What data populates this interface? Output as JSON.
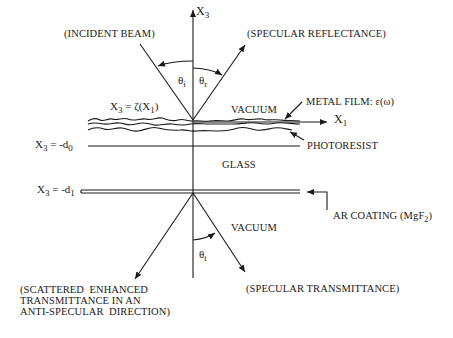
{
  "diagram": {
    "axes": {
      "vertical_label": "X",
      "vertical_sub": "3",
      "horizontal_label": "X",
      "horizontal_sub": "1"
    },
    "beams": {
      "incident": "(INCIDENT  BEAM)",
      "specular_reflectance": "(SPECULAR  REFLECTANCE)",
      "specular_transmittance": "(SPECULAR  TRANSMITTANCE)",
      "scattered_enhanced": "(SCATTERED  ENHANCED\nTRANSMITTANCE IN AN\nANTI-SPECULAR  DIRECTION)"
    },
    "angles": {
      "incident": {
        "sym": "θ",
        "sub": "i"
      },
      "reflected": {
        "sym": "θ",
        "sub": "r"
      },
      "transmitted": {
        "sym": "θ",
        "sub": "t"
      }
    },
    "regions": {
      "vacuum_top": "VACUUM",
      "glass": "GLASS",
      "vacuum_bottom": "VACUUM"
    },
    "layers": {
      "metal_film": "METAL  FILM:  ε(ω)",
      "photoresist": "PHOTORESIST",
      "ar_coating_prefix": "AR  COATING  (MgF",
      "ar_coating_sub": "2",
      "ar_coating_suffix": ")"
    },
    "interfaces": {
      "surface": {
        "lhs": "X",
        "lhs_sub": "3",
        "rhs": " = ζ(X",
        "rhs_sub": "1",
        "close": ")"
      },
      "d0": {
        "lhs": "X",
        "lhs_sub": "3",
        "rhs": " = -d",
        "rhs_sub": "0"
      },
      "d1": {
        "lhs": "X",
        "lhs_sub": "3",
        "rhs": " = -d",
        "rhs_sub": "1"
      }
    }
  }
}
